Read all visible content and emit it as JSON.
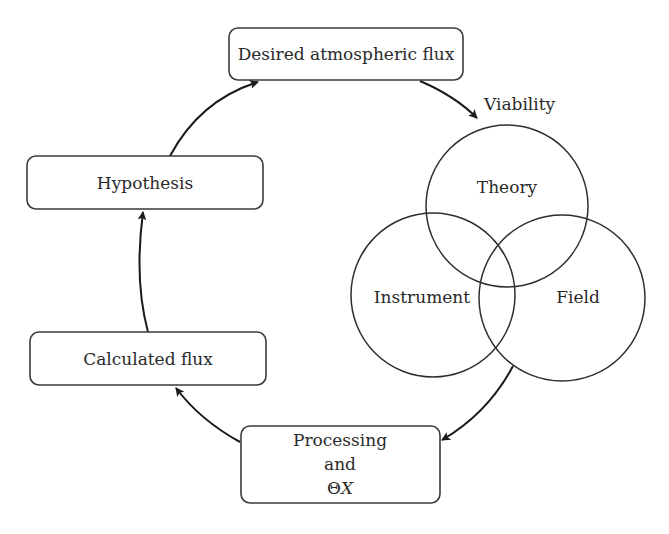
{
  "diagram": {
    "nodes": {
      "desired_flux": {
        "label": "Desired atmospheric flux"
      },
      "hypothesis": {
        "label": "Hypothesis"
      },
      "calculated_flux": {
        "label": "Calculated flux"
      },
      "processing": {
        "line1": "Processing",
        "line2": "and",
        "line3_symbol": "Θ",
        "line3_var": "X"
      }
    },
    "viability": {
      "title": "Viability",
      "circles": {
        "theory": "Theory",
        "instrument": "Instrument",
        "field": "Field"
      }
    },
    "edges": [
      {
        "from": "desired_flux",
        "to": "viability"
      },
      {
        "from": "viability",
        "to": "processing"
      },
      {
        "from": "processing",
        "to": "calculated_flux"
      },
      {
        "from": "calculated_flux",
        "to": "hypothesis"
      },
      {
        "from": "hypothesis",
        "to": "desired_flux"
      }
    ],
    "colors": {
      "stroke": "#2e2e2e",
      "text": "#2a2a2a",
      "background": "#ffffff"
    }
  }
}
